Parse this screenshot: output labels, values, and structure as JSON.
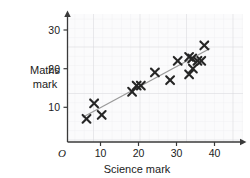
{
  "chart_data": {
    "type": "scatter",
    "title": "",
    "xlabel": "Science mark",
    "ylabel_line1": "Maths",
    "ylabel_line2": "mark",
    "origin_label": "O",
    "xlim": [
      0,
      45
    ],
    "ylim": [
      0,
      33
    ],
    "xticks": [
      10,
      20,
      30,
      40
    ],
    "xtick_labels": [
      "10",
      "20",
      "30",
      "40"
    ],
    "yticks": [
      10,
      20,
      30
    ],
    "ytick_labels": [
      "10",
      "20",
      "30"
    ],
    "grid": true,
    "grid_major_step": 10,
    "grid_minor_step": 2,
    "legend": "none",
    "marker": "x",
    "marker_color": "#262626",
    "points": [
      {
        "x": 5,
        "y": 6
      },
      {
        "x": 7,
        "y": 10
      },
      {
        "x": 9,
        "y": 7
      },
      {
        "x": 17,
        "y": 13
      },
      {
        "x": 18.2,
        "y": 14.6
      },
      {
        "x": 19.3,
        "y": 14.6
      },
      {
        "x": 23,
        "y": 18
      },
      {
        "x": 27,
        "y": 16
      },
      {
        "x": 29,
        "y": 21
      },
      {
        "x": 32,
        "y": 17.5
      },
      {
        "x": 32,
        "y": 22
      },
      {
        "x": 32.8,
        "y": 21.6
      },
      {
        "x": 33,
        "y": 19
      },
      {
        "x": 34.2,
        "y": 21
      },
      {
        "x": 35.2,
        "y": 21
      },
      {
        "x": 36,
        "y": 25
      }
    ],
    "trend_line": {
      "label": "line of best fit",
      "color": "#9a9a9a",
      "x1": 4,
      "y1": 6.4,
      "x2": 37.5,
      "y2": 24.2
    },
    "axis_color": "#3a3a3a",
    "grid_major_color": "#d9d9dd",
    "grid_minor_color": "#ececf0",
    "plot_bg": "#fbfbfc"
  }
}
